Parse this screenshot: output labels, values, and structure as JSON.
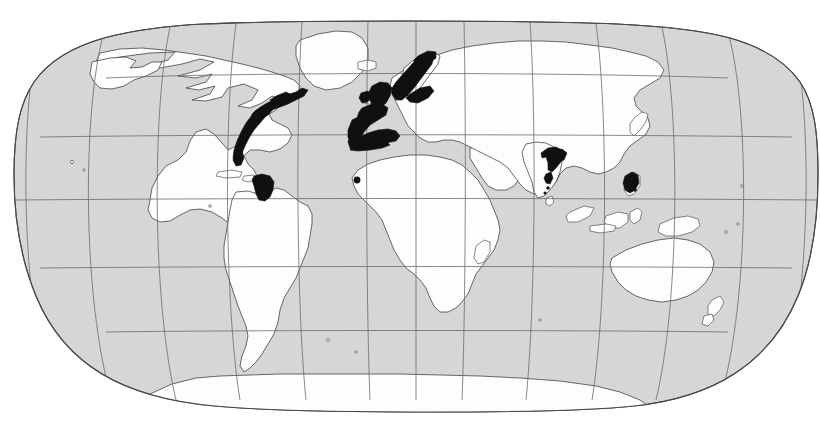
{
  "figure": {
    "kind": "world-distribution-map",
    "title": "",
    "projection": "Robinson",
    "background_color": "#ffffff",
    "ocean_color": "#d6d6d6",
    "land_color": "#fdfdfd",
    "coastline_color": "#3a3a3a",
    "graticule_color": "#6b6b6b",
    "highlight_color": "#101010",
    "frame_border_color": "#4a4a4a",
    "width_px": 820,
    "height_px": 431
  },
  "graticule": {
    "meridian_interval_deg": 30,
    "parallel_interval_deg": 30,
    "meridians_deg": [
      -180,
      -150,
      -120,
      -90,
      -60,
      -30,
      0,
      30,
      60,
      90,
      120,
      150,
      180
    ],
    "parallels_deg": [
      -60,
      -30,
      0,
      30,
      60
    ],
    "equator_deg": 0,
    "visible": true
  },
  "legend": {
    "visible": false,
    "entries": [
      {
        "swatch_color": "#101010",
        "label": ""
      }
    ]
  },
  "continents": [
    {
      "name": "North America",
      "interactable": false
    },
    {
      "name": "Greenland",
      "interactable": false
    },
    {
      "name": "South America",
      "interactable": false
    },
    {
      "name": "Europe",
      "interactable": false
    },
    {
      "name": "Africa",
      "interactable": false
    },
    {
      "name": "Asia",
      "interactable": false
    },
    {
      "name": "Australia",
      "interactable": false
    },
    {
      "name": "Antarctica",
      "interactable": false
    },
    {
      "name": "Madagascar",
      "interactable": false
    },
    {
      "name": "New Zealand",
      "interactable": false
    },
    {
      "name": "Japan",
      "interactable": false
    },
    {
      "name": "Indonesia",
      "interactable": false
    },
    {
      "name": "Philippines",
      "interactable": false
    },
    {
      "name": "British Isles",
      "interactable": false
    },
    {
      "name": "Iceland",
      "interactable": false
    },
    {
      "name": "Caribbean Islands",
      "interactable": false
    }
  ],
  "highlight_regions": [
    {
      "id": "nw-atlantic",
      "label": "Northwest Atlantic coast (Nova Scotia to Florida)"
    },
    {
      "id": "caribbean-south",
      "label": "Southern Caribbean (Panama, Colombia, Venezuela)"
    },
    {
      "id": "british-isles",
      "label": "British Isles and North Sea"
    },
    {
      "id": "scandinavia-baltic",
      "label": "Scandinavia, Norwegian Sea and Baltic"
    },
    {
      "id": "iberia-biscay",
      "label": "Iberian Peninsula and Bay of Biscay"
    },
    {
      "id": "west-mediterranean",
      "label": "Western Mediterranean coast"
    },
    {
      "id": "west-africa",
      "label": "West African coast"
    },
    {
      "id": "bay-of-bengal",
      "label": "Northern Bay of Bengal / Ganges delta"
    },
    {
      "id": "east-india",
      "label": "Eastern India coast"
    },
    {
      "id": "philippines-luzon",
      "label": "Philippines (Luzon)"
    }
  ]
}
